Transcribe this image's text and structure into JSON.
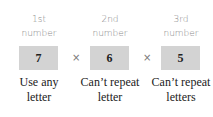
{
  "columns": [
    {
      "header_line1": "1st",
      "header_line2": "number",
      "value": "7",
      "note_line1": "Use any",
      "note_line2": "letter"
    },
    {
      "header_line1": "2nd",
      "header_line2": "number",
      "value": "6",
      "note_line1": "Can’t repeat",
      "note_line2": "letter"
    },
    {
      "header_line1": "3rd",
      "header_line2": "number",
      "value": "5",
      "note_line1": "Can’t repeat",
      "note_line2": "letters"
    }
  ],
  "operator": "×",
  "colors": {
    "box_fill": "#d3d3d3",
    "header_text": "#8a8a8a"
  }
}
